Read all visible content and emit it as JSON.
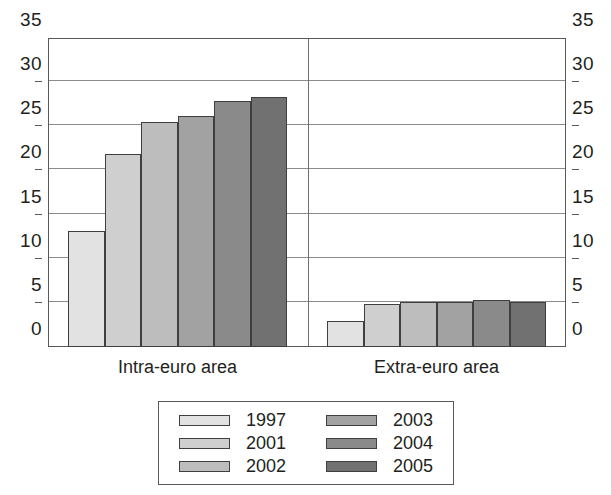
{
  "chart_data": {
    "type": "bar",
    "title": "",
    "subtitle": "",
    "xlabel": "",
    "ylabel": "",
    "categories": [
      "Intra-euro area",
      "Extra-euro area"
    ],
    "series": [
      {
        "name": "1997",
        "color": "#e2e2e2",
        "values": [
          13.1,
          2.9
        ]
      },
      {
        "name": "2001",
        "color": "#cfcfcf",
        "values": [
          21.9,
          4.9
        ]
      },
      {
        "name": "2002",
        "color": "#bdbdbd",
        "values": [
          25.5,
          5.1
        ]
      },
      {
        "name": "2003",
        "color": "#a2a2a2",
        "values": [
          26.2,
          5.1
        ]
      },
      {
        "name": "2004",
        "color": "#8a8a8a",
        "values": [
          27.9,
          5.3
        ]
      },
      {
        "name": "2005",
        "color": "#717171",
        "values": [
          28.3,
          5.1
        ]
      }
    ],
    "ylim": [
      0,
      35
    ],
    "yticks": [
      0,
      5,
      10,
      15,
      20,
      25,
      30,
      35
    ],
    "ytick_labels": [
      "0",
      "5",
      "10",
      "15",
      "20",
      "25",
      "30",
      "35"
    ],
    "grid": true,
    "grid_axis": "y",
    "dual_y_axis": true,
    "legend": {
      "position": "bottom",
      "columns": 2,
      "entries": [
        "1997",
        "2001",
        "2002",
        "2003",
        "2004",
        "2005"
      ]
    }
  },
  "axis": {
    "left_label_top": "35",
    "right_label_top": "35"
  }
}
